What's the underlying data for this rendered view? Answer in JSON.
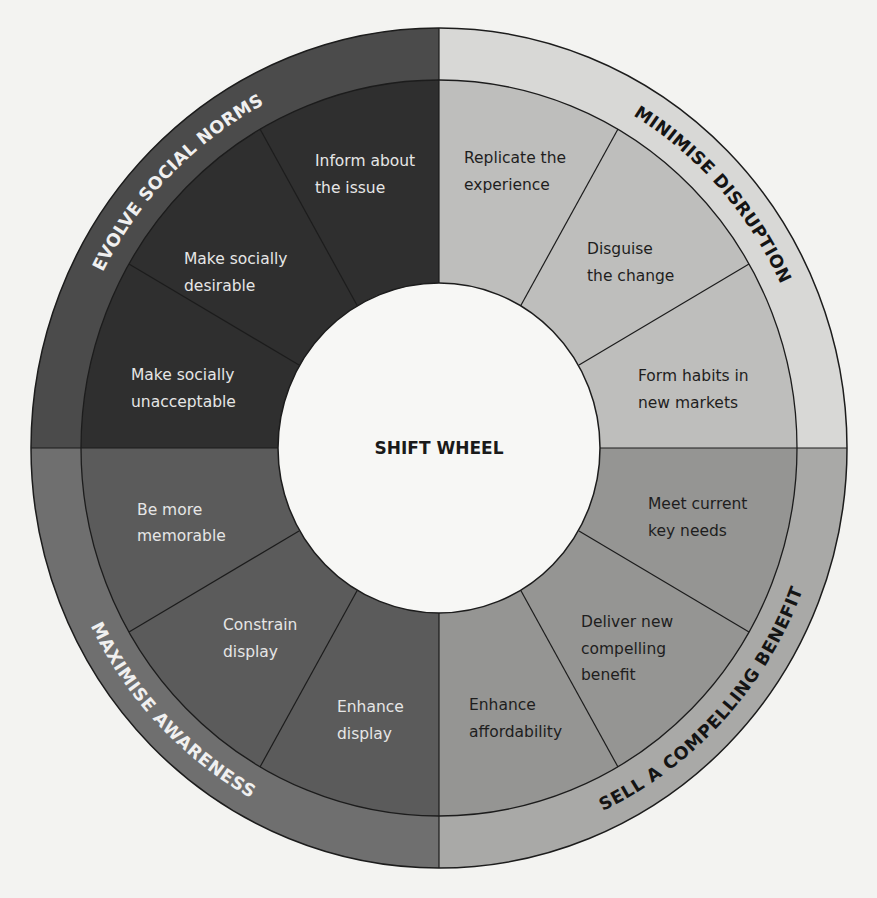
{
  "title": "SHIFT WHEEL",
  "colors": {
    "background": "#f3f3f1",
    "evolve_outer": "#4b4b4b",
    "evolve_inner": "#2f2f2f",
    "minimise_outer": "#d8d8d6",
    "minimise_inner": "#bebebc",
    "sell_outer": "#a9a9a7",
    "sell_inner": "#959593",
    "maximise_outer": "#6f6f6f",
    "maximise_inner": "#5b5b5b",
    "center": "#f7f7f5"
  },
  "quadrants": {
    "evolve": {
      "label": "EVOLVE SOCIAL NORMS",
      "segments": [
        {
          "line1": "Inform about",
          "line2": "the issue"
        },
        {
          "line1": "Make socially",
          "line2": "desirable"
        },
        {
          "line1": "Make socially",
          "line2": "unacceptable"
        }
      ]
    },
    "minimise": {
      "label": "MINIMISE DISRUPTION",
      "segments": [
        {
          "line1": "Replicate the",
          "line2": "experience"
        },
        {
          "line1": "Disguise",
          "line2": "the change"
        },
        {
          "line1": "Form habits in",
          "line2": "new markets"
        }
      ]
    },
    "sell": {
      "label": "SELL A COMPELLING BENEFIT",
      "segments": [
        {
          "line1": "Meet current",
          "line2": "key needs"
        },
        {
          "line1": "Deliver new",
          "line2": "compelling",
          "line3": "benefit"
        },
        {
          "line1": "Enhance",
          "line2": "affordability"
        }
      ]
    },
    "maximise": {
      "label": "MAXIMISE AWARENESS",
      "segments": [
        {
          "line1": "Be more",
          "line2": "memorable"
        },
        {
          "line1": "Constrain",
          "line2": "display"
        },
        {
          "line1": "Enhance",
          "line2": "display"
        }
      ]
    }
  }
}
